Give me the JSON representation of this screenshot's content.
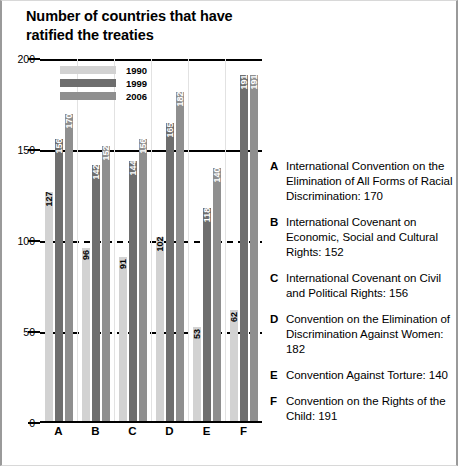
{
  "legend": {
    "items": [
      {
        "label": "1990",
        "color": "#d2d2d2"
      },
      {
        "label": "1999",
        "color": "#6e6e6e"
      },
      {
        "label": "2006",
        "color": "#8f8f8f"
      }
    ]
  },
  "key": {
    "items": [
      {
        "letter": "A",
        "text": "International Convention on the Elimination of All Forms of Racial Discrimination: 170"
      },
      {
        "letter": "B",
        "text": "International Covenant on Economic, Social and Cultural Rights: 152"
      },
      {
        "letter": "C",
        "text": "International Covenant on Civil and Political Rights: 156"
      },
      {
        "letter": "D",
        "text": "Convention on the Elimination of Discrimination Against Women: 182"
      },
      {
        "letter": "E",
        "text": "Convention Against Torture: 140"
      },
      {
        "letter": "F",
        "text": "Convention on the Rights of the Child: 191"
      }
    ]
  },
  "chart_data": {
    "type": "bar",
    "xlabel": "",
    "ylabel": "",
    "ylim": [
      0,
      200
    ],
    "yticks": [
      0,
      50,
      100,
      150,
      200
    ],
    "grid": true,
    "legend_position": "top-left",
    "categories": [
      "A",
      "B",
      "C",
      "D",
      "E",
      "F"
    ],
    "series": [
      {
        "name": "1990",
        "color": "#d2d2d2",
        "values": [
          127,
          96,
          91,
          102,
          53,
          62
        ]
      },
      {
        "name": "1999",
        "color": "#6e6e6e",
        "values": [
          156,
          142,
          144,
          165,
          118,
          191
        ]
      },
      {
        "name": "2006",
        "color": "#8f8f8f",
        "values": [
          170,
          152,
          156,
          182,
          140,
          191
        ]
      }
    ]
  }
}
